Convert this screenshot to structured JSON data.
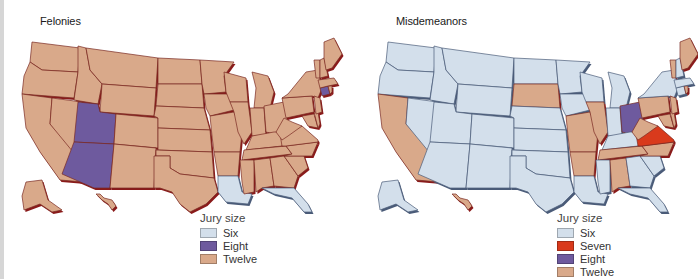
{
  "colors": {
    "six": "#d3dfeb",
    "seven": "#d93a1c",
    "eight": "#6e5a9e",
    "twelve": "#d9a98a",
    "border": "#7a2a22",
    "border_six": "#4a5b78",
    "shadow": "#8a1a1a"
  },
  "felonies": {
    "title": "Felonies",
    "legend": {
      "title": "Jury size",
      "items": [
        {
          "label": "Six",
          "key": "six"
        },
        {
          "label": "Eight",
          "key": "eight"
        },
        {
          "label": "Twelve",
          "key": "twelve"
        }
      ]
    },
    "states": {
      "default": "twelve",
      "UT": "eight",
      "AZ": "eight",
      "CT": "eight",
      "LA": "six",
      "FL": "six"
    }
  },
  "misdemeanors": {
    "title": "Misdemeanors",
    "legend": {
      "title": "Jury size",
      "items": [
        {
          "label": "Six",
          "key": "six"
        },
        {
          "label": "Seven",
          "key": "seven"
        },
        {
          "label": "Eight",
          "key": "eight"
        },
        {
          "label": "Twelve",
          "key": "twelve"
        }
      ]
    },
    "states": {
      "default": "six",
      "CA": "twelve",
      "SD": "twelve",
      "MO": "twelve",
      "IL": "twelve",
      "AR": "twelve",
      "TN": "twelve",
      "AL": "twelve",
      "NC": "twelve",
      "PA": "twelve",
      "WV": "twelve",
      "NJ": "twelve",
      "VT": "twelve",
      "ME": "twelve",
      "RI": "twelve",
      "HI": "twelve",
      "MD": "twelve",
      "DE": "twelve",
      "OH": "eight",
      "VA": "seven"
    }
  },
  "chart_data": [
    {
      "type": "choropleth",
      "title": "Felonies",
      "legend_title": "Jury size",
      "categories": [
        "Six",
        "Eight",
        "Twelve"
      ],
      "values": {
        "Six": [
          "Louisiana",
          "Florida"
        ],
        "Eight": [
          "Utah",
          "Arizona",
          "Connecticut"
        ],
        "Twelve": [
          "all other states"
        ]
      }
    },
    {
      "type": "choropleth",
      "title": "Misdemeanors",
      "legend_title": "Jury size",
      "categories": [
        "Six",
        "Seven",
        "Eight",
        "Twelve"
      ],
      "values": {
        "Seven": [
          "Virginia"
        ],
        "Eight": [
          "Ohio"
        ],
        "Twelve": [
          "California",
          "South Dakota",
          "Missouri",
          "Illinois",
          "Arkansas",
          "Tennessee",
          "Alabama",
          "North Carolina",
          "Pennsylvania",
          "West Virginia",
          "New Jersey",
          "Maryland",
          "Delaware",
          "Vermont",
          "Maine",
          "Rhode Island",
          "Hawaii"
        ],
        "Six": [
          "all other states"
        ]
      }
    }
  ]
}
